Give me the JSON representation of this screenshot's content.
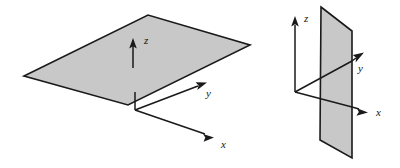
{
  "figure": {
    "background_color": "#ffffff",
    "plane_fill_color": "#c8c8c8",
    "plane_stroke_color": "#1a1a1a",
    "axis_color": "#1a1a1a",
    "panels": [
      {
        "name": "horizontal-plane-panel",
        "description": "Horizontal xy-plane drawn in oblique projection with vertical z axis arrow",
        "plane_orientation": "horizontal",
        "plane_polygon": "24,76 148,15 250,45 128,105",
        "origin": {
          "x": 135,
          "y": 108
        },
        "axes": [
          {
            "label": "z",
            "direction": "up",
            "label_x": 144,
            "label_y": 44
          },
          {
            "label": "y",
            "direction": "up-right",
            "label_x": 206,
            "label_y": 97
          },
          {
            "label": "x",
            "direction": "down-right",
            "label_x": 221,
            "label_y": 148
          }
        ]
      },
      {
        "name": "vertical-plane-panel",
        "description": "Vertical yz-plane drawn in oblique projection with vertical z axis arrow",
        "plane_orientation": "vertical",
        "plane_polygon": "321,7 352,31 352,158 320,140",
        "origin": {
          "x": 295,
          "y": 92
        },
        "axes": [
          {
            "label": "z",
            "direction": "up",
            "label_x": 304,
            "label_y": 22
          },
          {
            "label": "y",
            "direction": "up-right",
            "label_x": 358,
            "label_y": 72
          },
          {
            "label": "x",
            "direction": "right",
            "label_x": 376,
            "label_y": 116
          }
        ]
      }
    ]
  }
}
